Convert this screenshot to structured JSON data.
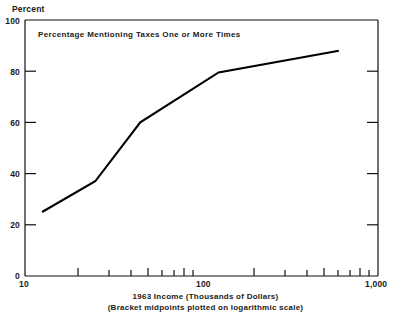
{
  "chart_data": {
    "type": "line",
    "title": "",
    "annotation": "Percentage Mentioning Taxes One or More Times",
    "xlabel": "1963 Income (Thousands of Dollars)",
    "xlabel_sub": "(Bracket midpoints plotted on logarithmic scale)",
    "ylabel": "Percent",
    "xscale": "log",
    "xlim": [
      10,
      1000
    ],
    "ylim": [
      0,
      100
    ],
    "grid": false,
    "legend": "none",
    "x_tick_labels": [
      "10",
      "100",
      "1,000"
    ],
    "x_tick_values": [
      10,
      100,
      1000
    ],
    "x_minor_ticks": [
      20,
      30,
      40,
      50,
      60,
      70,
      80,
      90,
      200,
      300,
      400,
      500,
      600,
      700,
      800,
      900
    ],
    "y_tick_labels": [
      "0",
      "20",
      "40",
      "60",
      "80",
      "100"
    ],
    "y_tick_values": [
      0,
      20,
      40,
      60,
      80,
      100
    ],
    "line_color": "#000000",
    "x": [
      12.5,
      25,
      45,
      125,
      600
    ],
    "values": [
      25,
      37,
      60,
      79.5,
      88
    ],
    "series": [
      {
        "name": "Percentage Mentioning Taxes One or More Times",
        "x": [
          12.5,
          25,
          45,
          125,
          600
        ],
        "values": [
          25,
          37,
          60,
          79.5,
          88
        ]
      }
    ]
  }
}
